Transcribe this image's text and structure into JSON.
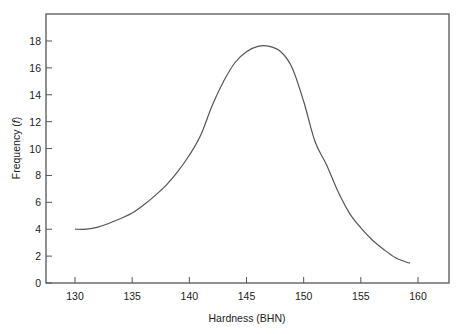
{
  "chart_data": {
    "type": "line",
    "title": "",
    "xlabel": "Hardness (BHN)",
    "ylabel": "Frequency (f)",
    "ylabel_parts": {
      "text": "Frequency (",
      "var": "f",
      "close": ")"
    },
    "xlim": [
      127.5,
      163
    ],
    "ylim": [
      0,
      20
    ],
    "xticks": [
      130,
      135,
      140,
      145,
      150,
      155,
      160
    ],
    "yticks": [
      0,
      2,
      4,
      6,
      8,
      10,
      12,
      14,
      16,
      18
    ],
    "grid": false,
    "legend": null,
    "series": [
      {
        "name": "Hardness distribution",
        "x": [
          130,
          131,
          132,
          133,
          134,
          135,
          136,
          137,
          138,
          139,
          140,
          141,
          142,
          143,
          144,
          145,
          146,
          147,
          148,
          149,
          150,
          151,
          152,
          153,
          154,
          155,
          156,
          157,
          158,
          159,
          159.3
        ],
        "y": [
          4.0,
          4.0,
          4.15,
          4.45,
          4.8,
          5.2,
          5.8,
          6.5,
          7.3,
          8.3,
          9.5,
          11.0,
          13.2,
          15.0,
          16.4,
          17.2,
          17.6,
          17.6,
          17.2,
          16.0,
          13.5,
          10.5,
          8.8,
          6.8,
          5.2,
          4.1,
          3.2,
          2.5,
          1.9,
          1.55,
          1.5
        ]
      }
    ]
  }
}
